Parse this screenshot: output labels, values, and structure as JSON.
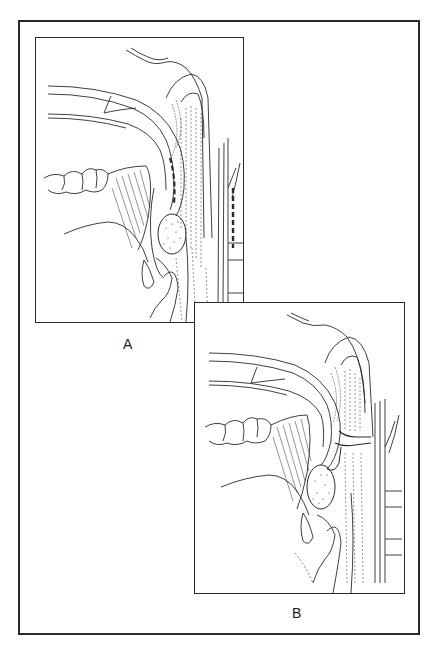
{
  "figure": {
    "type": "anatomical line drawing",
    "panels": [
      {
        "id": "A",
        "label": "A",
        "description": "Sagittal view with dashed incision lines along soft palate and posterior pharyngeal wall"
      },
      {
        "id": "B",
        "label": "B",
        "description": "Sagittal view showing pharyngeal flap connecting soft palate to posterior pharyngeal wall"
      }
    ],
    "colors": {
      "line": "#2a2a2a",
      "background": "#ffffff"
    }
  }
}
